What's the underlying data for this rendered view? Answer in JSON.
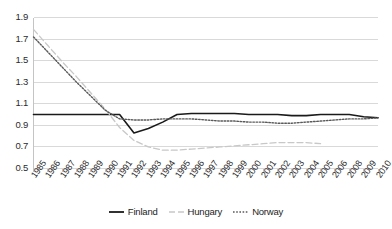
{
  "chart_data": {
    "type": "line",
    "title": "",
    "xlabel": "",
    "ylabel": "",
    "ylim": [
      0.5,
      1.9
    ],
    "y_ticks": [
      "0.5",
      "0.7",
      "0.9",
      "1.1",
      "1.3",
      "1.5",
      "1.7",
      "1.9"
    ],
    "grid": true,
    "legend_position": "bottom",
    "categories": [
      "1985",
      "1986",
      "1987",
      "1988",
      "1989",
      "1990",
      "1991",
      "1992",
      "1993",
      "1994",
      "1995",
      "1996",
      "1997",
      "1998",
      "1999",
      "2000",
      "2001",
      "2002",
      "2003",
      "2004",
      "2005",
      "2006",
      "2008",
      "2009",
      "2010"
    ],
    "series": [
      {
        "name": "Finland",
        "style": "solid",
        "color": "#1a1a1a",
        "values": [
          1.0,
          1.0,
          1.0,
          1.0,
          1.0,
          1.0,
          1.0,
          0.83,
          0.87,
          0.93,
          1.0,
          1.01,
          1.01,
          1.01,
          1.01,
          1.0,
          1.0,
          1.0,
          0.99,
          0.99,
          1.0,
          1.0,
          1.0,
          0.98,
          0.97
        ]
      },
      {
        "name": "Hungary",
        "style": "dashed",
        "color": "#c8c8c8",
        "values": [
          1.79,
          1.64,
          1.49,
          1.35,
          1.2,
          1.05,
          0.88,
          0.76,
          0.7,
          0.67,
          0.67,
          0.68,
          0.69,
          0.7,
          0.71,
          0.72,
          0.73,
          0.74,
          0.74,
          0.74,
          0.73,
          null,
          null,
          null,
          null
        ]
      },
      {
        "name": "Norway",
        "style": "dotted",
        "color": "#5a5a5a",
        "values": [
          1.72,
          1.58,
          1.44,
          1.3,
          1.17,
          1.04,
          0.96,
          0.95,
          0.95,
          0.96,
          0.96,
          0.96,
          0.95,
          0.94,
          0.94,
          0.93,
          0.93,
          0.92,
          0.92,
          0.93,
          0.94,
          0.95,
          0.96,
          0.96,
          0.97
        ]
      }
    ]
  },
  "legend": {
    "items": [
      {
        "label": "Finland"
      },
      {
        "label": "Hungary"
      },
      {
        "label": "Norway"
      }
    ]
  }
}
